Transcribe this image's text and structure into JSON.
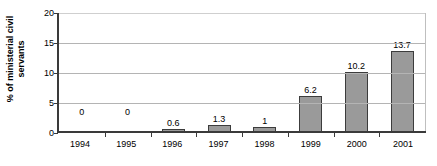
{
  "chart_data": {
    "type": "bar",
    "title": "",
    "xlabel": "",
    "ylabel": "% of ministerial civil\nservants",
    "categories": [
      "1994",
      "1995",
      "1996",
      "1997",
      "1998",
      "1999",
      "2000",
      "2001"
    ],
    "values": [
      0,
      0,
      0.6,
      1.3,
      1,
      6.2,
      10.2,
      13.7
    ],
    "data_labels": [
      "0",
      "0",
      "0.6",
      "1.3",
      "1",
      "6.2",
      "10.2",
      "13.7"
    ],
    "ylim": [
      0,
      20
    ],
    "yticks": [
      0,
      5,
      10,
      15,
      20
    ],
    "ytick_labels": [
      "0",
      "5",
      "10",
      "15",
      "20"
    ],
    "grid": true,
    "legend": false,
    "bar_color": "#9a9a9a",
    "bar_border_color": "#3c3c3c",
    "axis_color": "#3a3a3a",
    "grid_color": "#b4b4b4",
    "text_color": "#000000",
    "background": "#ffffff"
  }
}
